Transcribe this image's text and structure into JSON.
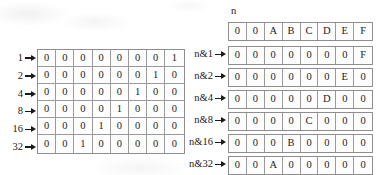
{
  "figure": {
    "left_table": {
      "row_labels": [
        "1",
        "2",
        "4",
        "8",
        "16",
        "32"
      ],
      "rows": [
        [
          "0",
          "0",
          "0",
          "0",
          "0",
          "0",
          "0",
          "1"
        ],
        [
          "0",
          "0",
          "0",
          "0",
          "0",
          "0",
          "1",
          "0"
        ],
        [
          "0",
          "0",
          "0",
          "0",
          "0",
          "1",
          "0",
          "0"
        ],
        [
          "0",
          "0",
          "0",
          "0",
          "1",
          "0",
          "0",
          "0"
        ],
        [
          "0",
          "0",
          "0",
          "1",
          "0",
          "0",
          "0",
          "0"
        ],
        [
          "0",
          "0",
          "1",
          "0",
          "0",
          "0",
          "0",
          "0"
        ]
      ]
    },
    "right_table": {
      "top_label": "n",
      "header_row": [
        "0",
        "0",
        "A",
        "B",
        "C",
        "D",
        "E",
        "F"
      ],
      "row_labels": [
        "n&1",
        "n&2",
        "n&4",
        "n&8",
        "n&16",
        "n&32"
      ],
      "rows": [
        [
          "0",
          "0",
          "0",
          "0",
          "0",
          "0",
          "0",
          "F"
        ],
        [
          "0",
          "0",
          "0",
          "0",
          "0",
          "0",
          "E",
          "0"
        ],
        [
          "0",
          "0",
          "0",
          "0",
          "0",
          "D",
          "0",
          "0"
        ],
        [
          "0",
          "0",
          "0",
          "0",
          "C",
          "0",
          "0",
          "0"
        ],
        [
          "0",
          "0",
          "0",
          "B",
          "0",
          "0",
          "0",
          "0"
        ],
        [
          "0",
          "0",
          "A",
          "0",
          "0",
          "0",
          "0",
          "0"
        ]
      ]
    },
    "arrow_icon_name": "right-arrow-icon",
    "colors": {
      "ink": "#1a1a1a",
      "grid_border": "#8e8e8e",
      "cell_border": "#9a9a9a",
      "paper": "#ffffff"
    }
  }
}
